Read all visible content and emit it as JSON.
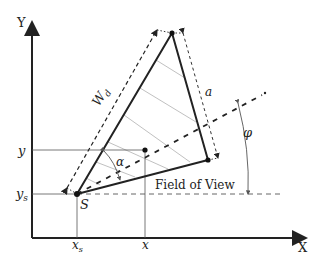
{
  "diagram": {
    "axes": {
      "x_label": "X",
      "y_label": "Y"
    },
    "ticks": {
      "x_s": "x",
      "x_s_sub": "s",
      "x": "x",
      "y": "y",
      "y_s": "y",
      "y_s_sub": "s"
    },
    "points": {
      "sensor_label": "S"
    },
    "annotations": {
      "width_label": "W",
      "width_sub": "d",
      "side_label": "a",
      "angle_alpha": "α",
      "angle_phi": "φ",
      "field_of_view": "Field of View"
    },
    "colors": {
      "line": "#222222",
      "thin": "#555555",
      "hatch": "#b0b0b0",
      "background": "#ffffff"
    }
  }
}
